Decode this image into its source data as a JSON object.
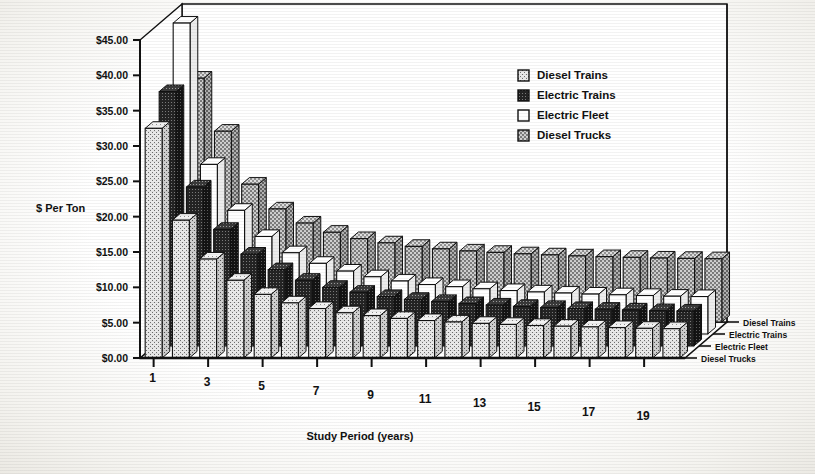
{
  "chart_data": {
    "type": "bar",
    "title": "",
    "subtitle": "",
    "xlabel": "Study Period (years)",
    "ylabel": "$ Per Ton",
    "ylim": [
      0,
      45
    ],
    "ytick_step": 5,
    "ytick_labels": [
      "$0.00",
      "$5.00",
      "$10.00",
      "$15.00",
      "$20.00",
      "$25.00",
      "$30.00",
      "$35.00",
      "$40.00",
      "$45.00"
    ],
    "ytick_values": [
      0,
      5,
      10,
      15,
      20,
      25,
      30,
      35,
      40,
      45
    ],
    "grid": false,
    "legend_position": "top-right",
    "projection": "3d-grouped-columns",
    "categories": [
      1,
      2,
      3,
      4,
      5,
      6,
      7,
      8,
      9,
      10,
      11,
      12,
      13,
      14,
      15,
      16,
      17,
      18,
      19,
      20
    ],
    "xtick_labels": [
      "1",
      "3",
      "5",
      "7",
      "9",
      "11",
      "13",
      "15",
      "17",
      "19"
    ],
    "xtick_categories": [
      1,
      3,
      5,
      7,
      9,
      11,
      13,
      15,
      17,
      19
    ],
    "series": [
      {
        "name": "Diesel Trains",
        "swatch": "#c9c9c9",
        "values": [
          32.5,
          19.5,
          14.0,
          11.0,
          9.0,
          7.8,
          7.0,
          6.4,
          6.0,
          5.6,
          5.3,
          5.1,
          4.9,
          4.75,
          4.6,
          4.5,
          4.4,
          4.3,
          4.2,
          4.15
        ]
      },
      {
        "name": "Electric Trains",
        "swatch": "#2b2b2b",
        "values": [
          36.0,
          22.5,
          16.5,
          13.0,
          10.8,
          9.3,
          8.3,
          7.6,
          7.0,
          6.6,
          6.3,
          6.0,
          5.8,
          5.6,
          5.45,
          5.3,
          5.2,
          5.1,
          5.0,
          4.95
        ]
      },
      {
        "name": "Electric Fleet",
        "swatch": "#ffffff",
        "values": [
          44.0,
          24.0,
          17.5,
          13.8,
          11.5,
          10.0,
          8.9,
          8.1,
          7.5,
          7.0,
          6.7,
          6.4,
          6.15,
          5.95,
          5.8,
          5.65,
          5.55,
          5.45,
          5.35,
          5.3
        ]
      },
      {
        "name": "Diesel Trucks",
        "swatch": "#9a9a9a",
        "values": [
          34.5,
          27.0,
          19.5,
          16.0,
          14.0,
          12.7,
          11.8,
          11.2,
          10.7,
          10.35,
          10.05,
          9.85,
          9.65,
          9.5,
          9.35,
          9.25,
          9.15,
          9.05,
          9.0,
          8.95
        ]
      }
    ]
  },
  "legend": {
    "items": [
      {
        "label": "Diesel Trains"
      },
      {
        "label": "Electric Trains"
      },
      {
        "label": "Electric Fleet"
      },
      {
        "label": "Diesel Trucks"
      }
    ]
  },
  "depth_axis": {
    "items": [
      {
        "label": "Diesel Trains"
      },
      {
        "label": "Electric Trains"
      },
      {
        "label": "Electric Fleet"
      },
      {
        "label": "Diesel Trucks"
      }
    ]
  },
  "axes": {
    "y_title": "$ Per Ton",
    "x_title": "Study Period (years)"
  }
}
